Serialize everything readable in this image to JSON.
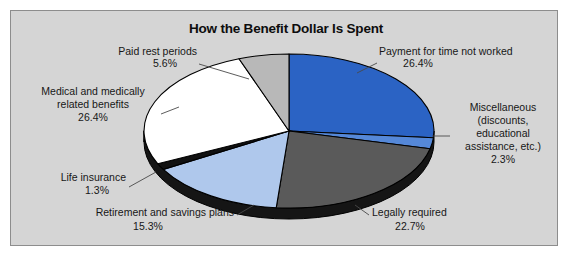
{
  "frame": {
    "background_color": "#d5d5d5",
    "border_color": "#8d8d8d"
  },
  "chart_data": {
    "type": "pie",
    "title": "How the Benefit Dollar Is Spent",
    "subtitle": "",
    "xlabel": "",
    "ylabel": "",
    "legend_position": "none",
    "grid": false,
    "three_d": true,
    "start_angle_deg": -90,
    "direction": "clockwise",
    "categories": [
      "Payment for time not worked",
      "Miscellaneous (discounts, educational assistance, etc.)",
      "Legally required",
      "Retirement and savings plans",
      "Life insurance",
      "Medical and medically related benefits",
      "Paid rest periods"
    ],
    "values": [
      26.4,
      2.3,
      22.7,
      15.3,
      1.3,
      26.4,
      5.6
    ],
    "value_suffix": "%",
    "colors": [
      "#2b63c4",
      "#5588d8",
      "#5a5a5a",
      "#afc8ec",
      "#111111",
      "#ffffff",
      "#b8b8b8"
    ],
    "slices": [
      {
        "label": "Payment for time not worked",
        "value": 26.4,
        "value_text": "26.4%",
        "color": "#2b63c4"
      },
      {
        "label": "Miscellaneous (discounts, educational assistance, etc.)",
        "value": 2.3,
        "value_text": "2.3%",
        "color": "#5588d8"
      },
      {
        "label": "Legally required",
        "value": 22.7,
        "value_text": "22.7%",
        "color": "#5a5a5a"
      },
      {
        "label": "Retirement and savings plans",
        "value": 15.3,
        "value_text": "15.3%",
        "color": "#afc8ec"
      },
      {
        "label": "Life insurance",
        "value": 1.3,
        "value_text": "1.3%",
        "color": "#111111"
      },
      {
        "label": "Medical and medically related benefits",
        "value": 26.4,
        "value_text": "26.4%",
        "color": "#ffffff"
      },
      {
        "label": "Paid rest periods",
        "value": 5.6,
        "value_text": "5.6%",
        "color": "#b8b8b8"
      }
    ]
  },
  "labels": {
    "paid_rest": {
      "line1": "Paid rest periods",
      "line2": "5.6%"
    },
    "payment_time": {
      "line1": "Payment for time not worked",
      "line2": "26.4%"
    },
    "medical": {
      "line1": "Medical and medically",
      "line2": "related benefits",
      "line3": "26.4%"
    },
    "miscellaneous": {
      "line1": "Miscellaneous",
      "line2": "(discounts,",
      "line3": "educational",
      "line4": "assistance, etc.)",
      "line5": "2.3%"
    },
    "life_insurance": {
      "line1": "Life insurance",
      "line2": "1.3%"
    },
    "retirement": {
      "line1": "Retirement and savings plans",
      "line2": "15.3%"
    },
    "legally_required": {
      "line1": "Legally required",
      "line2": "22.7%"
    }
  }
}
